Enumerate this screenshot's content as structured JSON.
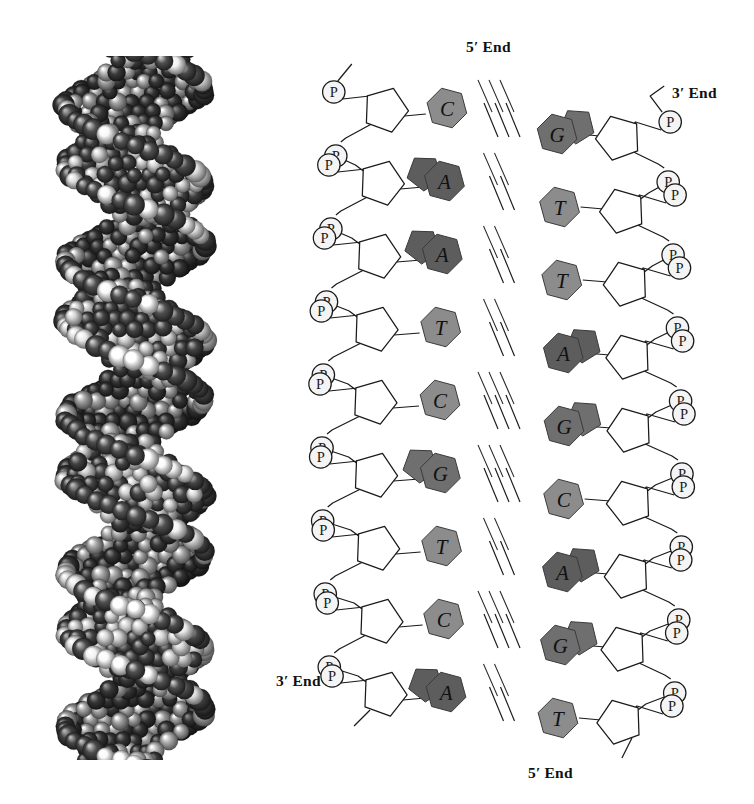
{
  "figure": {
    "panels": [
      "space-filling-model",
      "structural-diagram"
    ]
  },
  "labels": {
    "end_top_left": "5′ End",
    "end_top_right": "3′ End",
    "end_bottom_left": "3′ End",
    "end_bottom_right": "5′ End"
  },
  "legend": {
    "phosphate_symbol": "P",
    "sugar_shape": "pentagon",
    "hydrogen_bond_symbol": "///"
  },
  "colors": {
    "ink": "#1a1a1a",
    "purine_A": "#5d5d5d",
    "purine_G": "#6f6f6f",
    "pyrimidine_C": "#8c8c8c",
    "pyrimidine_T": "#8c8c8c",
    "phosphate_fill": "#f4f4f4",
    "background": "#ffffff",
    "model_dark_atom": "#4a4a4a",
    "model_light_atom": "#e8e8e8"
  },
  "chart_data": {
    "type": "diagram",
    "strands": [
      {
        "name": "left-strand",
        "five_prime": "top",
        "three_prime": "bottom",
        "sequence": [
          "C",
          "A",
          "A",
          "T",
          "C",
          "G",
          "T",
          "C",
          "A"
        ]
      },
      {
        "name": "right-strand",
        "five_prime": "bottom",
        "three_prime": "top",
        "sequence": [
          "G",
          "T",
          "T",
          "A",
          "G",
          "C",
          "A",
          "G",
          "T"
        ]
      }
    ],
    "base_pairs": [
      {
        "index": 1,
        "left": "C",
        "right": "G",
        "bonds": 3
      },
      {
        "index": 2,
        "left": "A",
        "right": "T",
        "bonds": 2
      },
      {
        "index": 3,
        "left": "A",
        "right": "T",
        "bonds": 2
      },
      {
        "index": 4,
        "left": "T",
        "right": "A",
        "bonds": 2
      },
      {
        "index": 5,
        "left": "C",
        "right": "G",
        "bonds": 3
      },
      {
        "index": 6,
        "left": "G",
        "right": "C",
        "bonds": 3
      },
      {
        "index": 7,
        "left": "T",
        "right": "A",
        "bonds": 2
      },
      {
        "index": 8,
        "left": "C",
        "right": "G",
        "bonds": 3
      },
      {
        "index": 9,
        "left": "A",
        "right": "T",
        "bonds": 2
      }
    ],
    "base_classes": {
      "A": "purine",
      "G": "purine",
      "C": "pyrimidine",
      "T": "pyrimidine"
    },
    "phosphate_count_left": 9,
    "phosphate_count_right": 9
  }
}
